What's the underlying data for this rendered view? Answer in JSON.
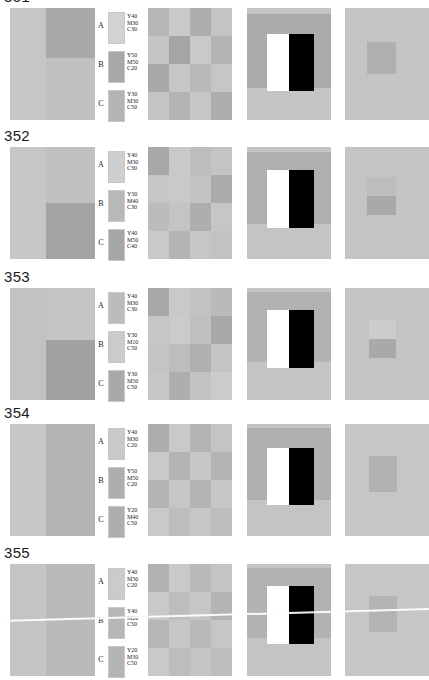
{
  "page": {
    "background": "#ffffff",
    "row_label_color": "#1a1a1a"
  },
  "legend_headers": {
    "a": "A",
    "b": "B",
    "c": "C"
  },
  "rows": [
    {
      "number": "351",
      "number_clipped": true,
      "top": -6,
      "panels_top": 8,
      "legend": [
        {
          "letter": "A",
          "swatch": "#d2d2d2",
          "y": "Y40",
          "m": "M30",
          "c": "C30"
        },
        {
          "letter": "B",
          "swatch": "#a8a8a8",
          "y": "Y50",
          "m": "M50",
          "c": "C20"
        },
        {
          "letter": "C",
          "swatch": "#b4b4b4",
          "y": "Y30",
          "m": "M30",
          "c": "C50"
        }
      ],
      "panel1": {
        "left": "#c6c6c6",
        "right": "#c1c1c1",
        "block_color": "#a9a9a9",
        "block_top": 0,
        "block_height": 50
      },
      "panel2": [
        "#b6b6b6",
        "#c9c9c9",
        "#aeaeae",
        "#c4c4c4",
        "#c4c4c4",
        "#a5a5a5",
        "#c9c9c9",
        "#b4b4b4",
        "#a9a9a9",
        "#c6c6c6",
        "#b9b9b9",
        "#c6c6c6",
        "#c4c4c4",
        "#b4b4b4",
        "#c6c6c6",
        "#aeaeae"
      ],
      "panel3": {
        "bg": "#c4c4c4",
        "band_color": "#ababab",
        "band_top": 6,
        "band_height": 74,
        "bar_top": 26,
        "bar_height": 57,
        "white_left": 20,
        "white_width": 22,
        "black_left": 42,
        "black_width": 25
      },
      "panel4": {
        "bg": "#c4c4c4",
        "square_color": "#b0b0b0",
        "square_color2": "#b0b0b0",
        "sq_left": 22,
        "sq_top": 34,
        "sq_width": 29,
        "sq_height": 32,
        "split": false
      }
    },
    {
      "number": "352",
      "number_clipped": false,
      "top": 124,
      "panels_top": 147,
      "legend": [
        {
          "letter": "A",
          "swatch": "#cfcfcf",
          "y": "Y40",
          "m": "M30",
          "c": "C30"
        },
        {
          "letter": "B",
          "swatch": "#b8b8b8",
          "y": "Y30",
          "m": "M40",
          "c": "C30"
        },
        {
          "letter": "C",
          "swatch": "#a6a6a6",
          "y": "Y40",
          "m": "M50",
          "c": "C40"
        }
      ],
      "panel1": {
        "left": "#c6c6c6",
        "right": "#c1c1c1",
        "block_color": "#a4a4a4",
        "block_top": 56,
        "block_height": 56
      },
      "panel2": [
        "#a8a8a8",
        "#c9c9c9",
        "#bdbdbd",
        "#c4c4c4",
        "#c6c6c6",
        "#c9c9c9",
        "#c2c2c2",
        "#ababab",
        "#bcbcbc",
        "#c4c4c4",
        "#aeaeae",
        "#c6c6c6",
        "#c9c9c9",
        "#b4b4b4",
        "#c6c6c6",
        "#c2c2c2"
      ],
      "panel3": {
        "bg": "#c4c4c4",
        "band_color": "#afafaf",
        "band_top": 5,
        "band_height": 72,
        "bar_top": 23,
        "bar_height": 58,
        "white_left": 20,
        "white_width": 22,
        "black_left": 42,
        "black_width": 25
      },
      "panel4": {
        "bg": "#c4c4c4",
        "square_color": "#bdbdbd",
        "square_color2": "#a9a9a9",
        "sq_left": 22,
        "sq_top": 30,
        "sq_width": 29,
        "sq_height": 38,
        "split": true
      }
    },
    {
      "number": "353",
      "number_clipped": false,
      "top": 268,
      "panels_top": 288,
      "legend": [
        {
          "letter": "A",
          "swatch": "#bcbcbc",
          "y": "Y40",
          "m": "M30",
          "c": "C30"
        },
        {
          "letter": "B",
          "swatch": "#cbcbcb",
          "y": "Y30",
          "m": "M10",
          "c": "C50"
        },
        {
          "letter": "C",
          "swatch": "#a9a9a9",
          "y": "Y30",
          "m": "M50",
          "c": "C50"
        }
      ],
      "panel1": {
        "left": "#c2c2c2",
        "right": "#c4c4c4",
        "block_color": "#a2a2a2",
        "block_top": 52,
        "block_height": 60
      },
      "panel2": [
        "#a9a9a9",
        "#c9c9c9",
        "#c2c2c2",
        "#bababa",
        "#c6c6c6",
        "#cbcbcb",
        "#bfbfbf",
        "#a8a8a8",
        "#c4c4c4",
        "#bdbdbd",
        "#b0b0b0",
        "#c4c4c4",
        "#c6c6c6",
        "#aeaeae",
        "#c2c2c2",
        "#cbcbcb"
      ],
      "panel3": {
        "bg": "#c4c4c4",
        "band_color": "#b2b2b2",
        "band_top": 4,
        "band_height": 70,
        "bar_top": 22,
        "bar_height": 58,
        "white_left": 20,
        "white_width": 22,
        "black_left": 42,
        "black_width": 25
      },
      "panel4": {
        "bg": "#c4c4c4",
        "square_color": "#cccccc",
        "square_color2": "#a9a9a9",
        "sq_left": 24,
        "sq_top": 32,
        "sq_width": 27,
        "sq_height": 38,
        "split": true
      }
    },
    {
      "number": "354",
      "number_clipped": false,
      "top": 406,
      "panels_top": 424,
      "legend": [
        {
          "letter": "A",
          "swatch": "#c9c9c9",
          "y": "Y40",
          "m": "M30",
          "c": "C20"
        },
        {
          "letter": "B",
          "swatch": "#aeaeae",
          "y": "Y50",
          "m": "M50",
          "c": "C20"
        },
        {
          "letter": "C",
          "swatch": "#aeaeae",
          "y": "Y20",
          "m": "M40",
          "c": "C50"
        }
      ],
      "panel1": {
        "left": "#c6c6c6",
        "right": "#b4b4b4",
        "block_color": "#b4b4b4",
        "block_top": 0,
        "block_height": 112
      },
      "panel2": [
        "#aeaeae",
        "#c9c9c9",
        "#b4b4b4",
        "#c4c4c4",
        "#c9c9c9",
        "#b4b4b4",
        "#c6c6c6",
        "#b4b4b4",
        "#b4b4b4",
        "#c6c6c6",
        "#b4b4b4",
        "#c6c6c6",
        "#c9c9c9",
        "#bdbdbd",
        "#c6c6c6",
        "#bdbdbd"
      ],
      "panel3": {
        "bg": "#c4c4c4",
        "band_color": "#b0b0b0",
        "band_top": 4,
        "band_height": 72,
        "bar_top": 24,
        "bar_height": 57,
        "white_left": 20,
        "white_width": 22,
        "black_left": 42,
        "black_width": 25
      },
      "panel4": {
        "bg": "#c6c6c6",
        "square_color": "#b2b2b2",
        "square_color2": "#b2b2b2",
        "sq_left": 24,
        "sq_top": 32,
        "sq_width": 28,
        "sq_height": 36,
        "split": false
      }
    },
    {
      "number": "355",
      "number_clipped": false,
      "top": 545,
      "panels_top": 564,
      "legend": [
        {
          "letter": "A",
          "swatch": "#cbcbcb",
          "y": "Y40",
          "m": "M30",
          "c": "C20"
        },
        {
          "letter": "B",
          "swatch": "#b6b6b6",
          "y": "Y40",
          "m": "M20",
          "c": "C50"
        },
        {
          "letter": "C",
          "swatch": "#b4b4b4",
          "y": "Y20",
          "m": "M30",
          "c": "C50"
        }
      ],
      "panel1": {
        "left": "#c4c4c4",
        "right": "#b9b9b9",
        "block_color": "#b9b9b9",
        "block_top": 0,
        "block_height": 105
      },
      "panel2": [
        "#b2b2b2",
        "#c9c9c9",
        "#b9b9b9",
        "#c4c4c4",
        "#c9c9c9",
        "#bdbdbd",
        "#c6c6c6",
        "#b4b4b4",
        "#b6b6b6",
        "#c6c6c6",
        "#b9b9b9",
        "#c6c6c6",
        "#c9c9c9",
        "#bdbdbd",
        "#c4c4c4",
        "#bdbdbd"
      ],
      "panel3": {
        "bg": "#c4c4c4",
        "band_color": "#b2b2b2",
        "band_top": 4,
        "band_height": 70,
        "bar_top": 22,
        "bar_height": 58,
        "white_left": 20,
        "white_width": 22,
        "black_left": 42,
        "black_width": 25
      },
      "panel4": {
        "bg": "#c6c6c6",
        "square_color": "#b4b4b4",
        "square_color2": "#b4b4b4",
        "sq_left": 24,
        "sq_top": 32,
        "sq_width": 28,
        "sq_height": 36,
        "split": false
      }
    }
  ],
  "artifacts": {
    "scanline": {
      "present": true,
      "top": 620,
      "angle_deg": -1.6,
      "color": "#fdfdfd"
    }
  }
}
